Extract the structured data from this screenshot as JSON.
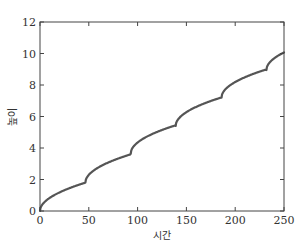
{
  "chart_data": {
    "type": "line",
    "title": "",
    "xlabel": "시간",
    "ylabel": "높이",
    "xlim": [
      0,
      250
    ],
    "ylim": [
      0,
      12
    ],
    "xticks": [
      0,
      50,
      100,
      150,
      200,
      250
    ],
    "yticks": [
      0,
      2,
      4,
      6,
      8,
      10,
      12
    ],
    "grid": false,
    "legend": null,
    "line_color": "#555555",
    "series": [
      {
        "name": "height",
        "description": "Piecewise concave (square-root-like) growth with periodic kinks roughly every 46.5 time units",
        "x": [
          0,
          5,
          10,
          20,
          30,
          40,
          46.5,
          50,
          60,
          70,
          80,
          93,
          100,
          110,
          120,
          130,
          139,
          145,
          155,
          165,
          175,
          186,
          190,
          200,
          210,
          220,
          232,
          235,
          240,
          245,
          250
        ],
        "values": [
          0,
          0.6,
          0.85,
          1.2,
          1.45,
          1.67,
          1.8,
          2.15,
          2.65,
          3.0,
          3.3,
          3.65,
          4.15,
          4.6,
          4.95,
          5.2,
          5.4,
          5.95,
          6.45,
          6.8,
          7.05,
          7.2,
          7.65,
          8.2,
          8.55,
          8.8,
          8.95,
          9.4,
          9.75,
          9.97,
          10.15
        ]
      }
    ],
    "kinks": [
      {
        "x": 46.5,
        "y": 1.8
      },
      {
        "x": 93,
        "y": 3.65
      },
      {
        "x": 139,
        "y": 5.4
      },
      {
        "x": 186,
        "y": 7.2
      },
      {
        "x": 232,
        "y": 8.95
      }
    ]
  }
}
